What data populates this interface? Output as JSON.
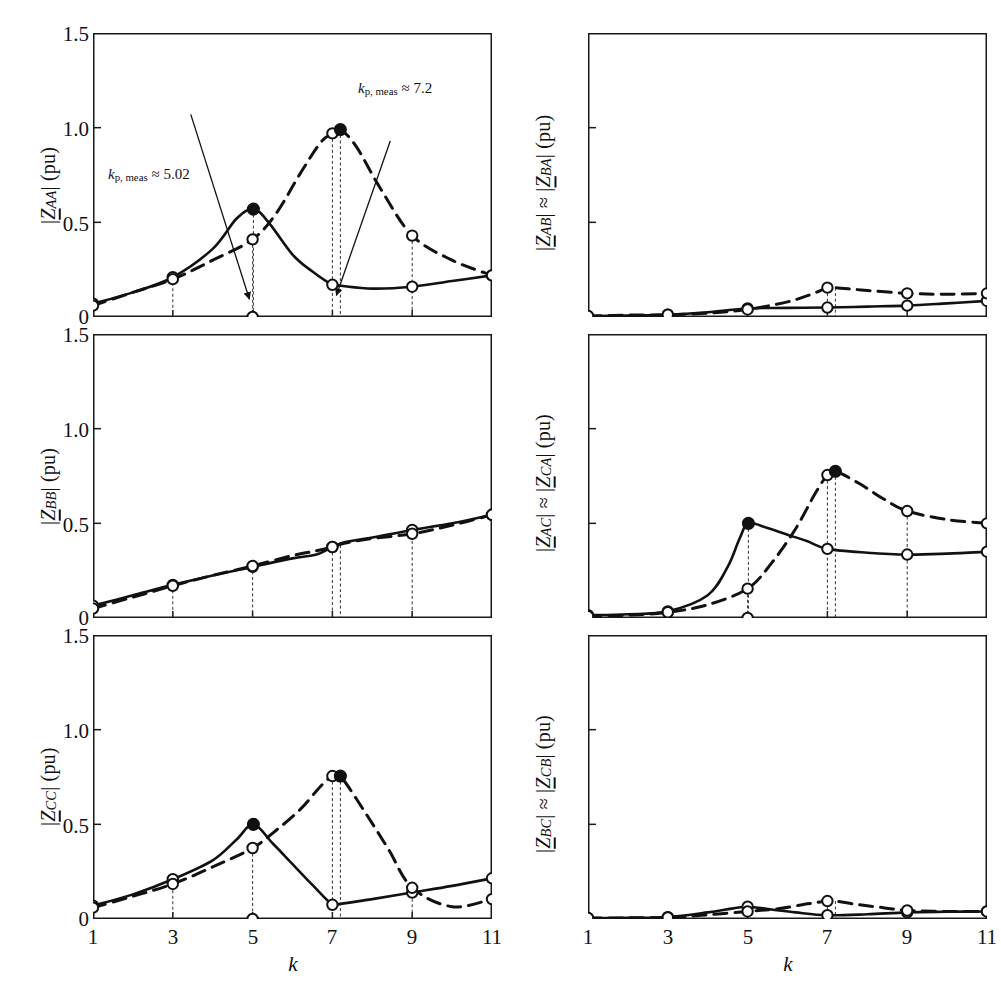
{
  "figure": {
    "xlabel": "k",
    "x_ticks": [
      "1",
      "3",
      "5",
      "7",
      "9",
      "11"
    ],
    "y_ticks": [
      "0",
      "0.5",
      "1.0",
      "1.5"
    ],
    "annotations": [
      {
        "id": "kp502",
        "text_prefix": "k",
        "text_sub": "p, meas",
        "text_value": " ≈ 5.02"
      },
      {
        "id": "kp72",
        "text_prefix": "k",
        "text_sub": "p, meas",
        "text_value": " ≈ 7.2"
      }
    ],
    "panels": [
      {
        "id": "ZAA",
        "ylabel_plain": "|Z_AA| (pu)"
      },
      {
        "id": "ZAB",
        "ylabel_plain": "|Z_AB| ≈ |Z_BA| (pu)"
      },
      {
        "id": "ZBB",
        "ylabel_plain": "|Z_BB| (pu)"
      },
      {
        "id": "ZAC",
        "ylabel_plain": "|Z_AC| ≈ |Z_CA| (pu)"
      },
      {
        "id": "ZCC",
        "ylabel_plain": "|Z_CC| (pu)"
      },
      {
        "id": "ZBC",
        "ylabel_plain": "|Z_BC| ≈ |Z_CB| (pu)"
      }
    ]
  },
  "chart_data": [
    {
      "type": "line",
      "id": "ZAA",
      "title": "",
      "xlabel": "k",
      "ylabel": "|Z_AA| (pu)",
      "xlim": [
        1,
        11
      ],
      "ylim": [
        0,
        1.5
      ],
      "xticks": [
        1,
        3,
        5,
        7,
        9,
        11
      ],
      "yticks": [
        0,
        0.5,
        1.0,
        1.5
      ],
      "grid": false,
      "legend": "none",
      "series": [
        {
          "name": "solid",
          "style": "solid",
          "x": [
            1,
            2,
            3,
            4,
            4.6,
            5.02,
            5.4,
            6,
            6.5,
            7,
            7.2,
            8,
            9,
            10,
            11
          ],
          "y": [
            0.07,
            0.13,
            0.21,
            0.36,
            0.52,
            0.57,
            0.5,
            0.33,
            0.24,
            0.17,
            0.165,
            0.15,
            0.16,
            0.19,
            0.22
          ],
          "markers_open_x": [
            1,
            3,
            5,
            7,
            9,
            11
          ],
          "markers_open_y": [
            0.07,
            0.21,
            0.0,
            0.17,
            0.16,
            0.22
          ],
          "markers_filled_x": [
            5.02
          ],
          "markers_filled_y": [
            0.57
          ]
        },
        {
          "name": "dashed",
          "style": "dashed",
          "x": [
            1,
            2,
            3,
            4,
            5,
            5.6,
            6.2,
            6.7,
            7,
            7.2,
            7.6,
            8.2,
            9,
            10,
            11
          ],
          "y": [
            0.06,
            0.13,
            0.2,
            0.3,
            0.41,
            0.55,
            0.76,
            0.92,
            0.97,
            0.99,
            0.9,
            0.68,
            0.43,
            0.3,
            0.22
          ],
          "markers_open_x": [
            1,
            3,
            5,
            7,
            9,
            11
          ],
          "markers_open_y": [
            0.06,
            0.2,
            0.41,
            0.97,
            0.43,
            0.22
          ],
          "markers_filled_x": [
            7.2
          ],
          "markers_filled_y": [
            0.99
          ]
        }
      ],
      "drop_lines": [
        {
          "x": 5.02,
          "y_top": 0.57,
          "y_bottom": 0.0
        },
        {
          "x": 5.0,
          "y_top": 0.41,
          "y_bottom": 0.0
        },
        {
          "x": 7.0,
          "y_top": 0.97,
          "y_bottom": 0.0
        },
        {
          "x": 7.2,
          "y_top": 0.99,
          "y_bottom": 0.0
        },
        {
          "x": 9.0,
          "y_top": 0.43,
          "y_bottom": 0.0
        },
        {
          "x": 3.0,
          "y_top": 0.21,
          "y_bottom": 0.0
        }
      ],
      "annotations": [
        {
          "label": "k_p,meas = 5.02",
          "points_to_x": 5.02,
          "points_to_y": 0.02
        },
        {
          "label": "k_p,meas = 7.2",
          "points_to_x": 7.2,
          "points_to_y": 0.04
        }
      ]
    },
    {
      "type": "line",
      "id": "ZAB",
      "title": "",
      "xlabel": "k",
      "ylabel": "|Z_AB| ≈ |Z_BA| (pu)",
      "xlim": [
        1,
        11
      ],
      "ylim": [
        0,
        1.5
      ],
      "xticks": [
        1,
        3,
        5,
        7,
        9,
        11
      ],
      "yticks": [
        0,
        0.5,
        1.0,
        1.5
      ],
      "grid": false,
      "legend": "none",
      "series": [
        {
          "name": "solid",
          "style": "solid",
          "x": [
            1,
            2,
            3,
            4,
            5,
            6,
            7,
            8,
            9,
            10,
            11
          ],
          "y": [
            0.005,
            0.008,
            0.012,
            0.025,
            0.045,
            0.048,
            0.05,
            0.055,
            0.06,
            0.072,
            0.085
          ],
          "markers_open_x": [
            1,
            3,
            5,
            7,
            9,
            11
          ],
          "markers_open_y": [
            0.005,
            0.012,
            0.045,
            0.05,
            0.06,
            0.085
          ],
          "markers_filled_x": [],
          "markers_filled_y": []
        },
        {
          "name": "dashed",
          "style": "dashed",
          "x": [
            1,
            2,
            3,
            4,
            5,
            6,
            6.6,
            7,
            7.2,
            8,
            9,
            10,
            11
          ],
          "y": [
            0.005,
            0.01,
            0.012,
            0.02,
            0.04,
            0.08,
            0.12,
            0.155,
            0.155,
            0.14,
            0.125,
            0.12,
            0.125
          ],
          "markers_open_x": [
            1,
            3,
            5,
            7,
            9,
            11
          ],
          "markers_open_y": [
            0.005,
            0.012,
            0.04,
            0.155,
            0.125,
            0.125
          ],
          "markers_filled_x": [],
          "markers_filled_y": []
        }
      ],
      "drop_lines": [
        {
          "x": 7.0,
          "y_top": 0.155,
          "y_bottom": 0.0
        },
        {
          "x": 7.2,
          "y_top": 0.155,
          "y_bottom": 0.0
        },
        {
          "x": 9.0,
          "y_top": 0.125,
          "y_bottom": 0.0
        }
      ],
      "annotations": []
    },
    {
      "type": "line",
      "id": "ZBB",
      "title": "",
      "xlabel": "k",
      "ylabel": "|Z_BB| (pu)",
      "xlim": [
        1,
        11
      ],
      "ylim": [
        0,
        1.5
      ],
      "xticks": [
        1,
        3,
        5,
        7,
        9,
        11
      ],
      "yticks": [
        0,
        0.5,
        1.0,
        1.5
      ],
      "grid": false,
      "legend": "none",
      "series": [
        {
          "name": "solid",
          "style": "solid",
          "x": [
            1,
            2,
            3,
            4,
            5,
            6,
            6.6,
            7,
            7.3,
            8,
            9,
            10,
            11
          ],
          "y": [
            0.065,
            0.12,
            0.175,
            0.225,
            0.27,
            0.315,
            0.335,
            0.375,
            0.4,
            0.425,
            0.465,
            0.5,
            0.545
          ],
          "markers_open_x": [
            1,
            3,
            5,
            7,
            9,
            11
          ],
          "markers_open_y": [
            0.065,
            0.175,
            0.27,
            0.375,
            0.465,
            0.545
          ],
          "markers_filled_x": [],
          "markers_filled_y": []
        },
        {
          "name": "dashed",
          "style": "dashed",
          "x": [
            1,
            2,
            3,
            4,
            5,
            6,
            6.6,
            7,
            7.3,
            8,
            9,
            10,
            11
          ],
          "y": [
            0.05,
            0.11,
            0.17,
            0.225,
            0.275,
            0.33,
            0.355,
            0.375,
            0.395,
            0.42,
            0.445,
            0.49,
            0.545
          ],
          "markers_open_x": [
            1,
            3,
            5,
            7,
            9,
            11
          ],
          "markers_open_y": [
            0.05,
            0.17,
            0.275,
            0.375,
            0.445,
            0.545
          ],
          "markers_filled_x": [],
          "markers_filled_y": []
        }
      ],
      "drop_lines": [
        {
          "x": 3.0,
          "y_top": 0.175,
          "y_bottom": 0.0
        },
        {
          "x": 5.0,
          "y_top": 0.275,
          "y_bottom": 0.0
        },
        {
          "x": 7.0,
          "y_top": 0.375,
          "y_bottom": 0.0
        },
        {
          "x": 7.2,
          "y_top": 0.385,
          "y_bottom": 0.0
        },
        {
          "x": 9.0,
          "y_top": 0.465,
          "y_bottom": 0.0
        }
      ],
      "annotations": []
    },
    {
      "type": "line",
      "id": "ZAC",
      "title": "",
      "xlabel": "k",
      "ylabel": "|Z_AC| ≈ |Z_CA| (pu)",
      "xlim": [
        1,
        11
      ],
      "ylim": [
        0,
        1.5
      ],
      "xticks": [
        1,
        3,
        5,
        7,
        9,
        11
      ],
      "yticks": [
        0,
        0.5,
        1.0,
        1.5
      ],
      "grid": false,
      "legend": "none",
      "series": [
        {
          "name": "solid",
          "style": "solid",
          "x": [
            1,
            2,
            3,
            4,
            4.5,
            4.8,
            5.02,
            5.5,
            6,
            6.5,
            7,
            8,
            9,
            10,
            11
          ],
          "y": [
            0.015,
            0.02,
            0.035,
            0.12,
            0.27,
            0.42,
            0.5,
            0.475,
            0.44,
            0.405,
            0.365,
            0.345,
            0.335,
            0.34,
            0.35
          ],
          "markers_open_x": [
            1,
            3,
            5,
            7,
            9,
            11
          ],
          "markers_open_y": [
            0.015,
            0.035,
            0.0,
            0.365,
            0.335,
            0.35
          ],
          "markers_filled_x": [
            5.02
          ],
          "markers_filled_y": [
            0.5
          ]
        },
        {
          "name": "dashed",
          "style": "dashed",
          "x": [
            1,
            2,
            3,
            4,
            5,
            5.6,
            6.2,
            6.7,
            7,
            7.2,
            7.8,
            8.4,
            9,
            10,
            11
          ],
          "y": [
            0.01,
            0.015,
            0.03,
            0.07,
            0.155,
            0.29,
            0.47,
            0.66,
            0.755,
            0.775,
            0.71,
            0.63,
            0.565,
            0.52,
            0.5
          ],
          "markers_open_x": [
            1,
            3,
            5,
            7,
            9,
            11
          ],
          "markers_open_y": [
            0.01,
            0.03,
            0.155,
            0.755,
            0.565,
            0.5
          ],
          "markers_filled_x": [
            7.2
          ],
          "markers_filled_y": [
            0.775
          ]
        }
      ],
      "drop_lines": [
        {
          "x": 5.02,
          "y_top": 0.5,
          "y_bottom": 0.0
        },
        {
          "x": 5.0,
          "y_top": 0.155,
          "y_bottom": 0.0
        },
        {
          "x": 7.0,
          "y_top": 0.755,
          "y_bottom": 0.0
        },
        {
          "x": 7.2,
          "y_top": 0.775,
          "y_bottom": 0.0
        },
        {
          "x": 9.0,
          "y_top": 0.565,
          "y_bottom": 0.0
        }
      ],
      "annotations": []
    },
    {
      "type": "line",
      "id": "ZCC",
      "title": "",
      "xlabel": "k",
      "ylabel": "|Z_CC| (pu)",
      "xlim": [
        1,
        11
      ],
      "ylim": [
        0,
        1.5
      ],
      "xticks": [
        1,
        3,
        5,
        7,
        9,
        11
      ],
      "yticks": [
        0,
        0.5,
        1.0,
        1.5
      ],
      "grid": false,
      "legend": "none",
      "series": [
        {
          "name": "solid",
          "style": "solid",
          "x": [
            1,
            2,
            3,
            4,
            4.6,
            5.02,
            5.5,
            6,
            6.5,
            7,
            7.2,
            8,
            9,
            10,
            11
          ],
          "y": [
            0.07,
            0.13,
            0.21,
            0.31,
            0.42,
            0.5,
            0.4,
            0.29,
            0.18,
            0.075,
            0.08,
            0.105,
            0.14,
            0.175,
            0.215
          ],
          "markers_open_x": [
            1,
            3,
            5,
            7,
            9,
            11
          ],
          "markers_open_y": [
            0.07,
            0.21,
            0.0,
            0.075,
            0.14,
            0.215
          ],
          "markers_filled_x": [
            5.02
          ],
          "markers_filled_y": [
            0.5
          ]
        },
        {
          "name": "dashed",
          "style": "dashed",
          "x": [
            1,
            2,
            3,
            4,
            5,
            5.6,
            6.2,
            6.7,
            7,
            7.2,
            7.8,
            8.4,
            9,
            10,
            11
          ],
          "y": [
            0.06,
            0.12,
            0.185,
            0.275,
            0.375,
            0.47,
            0.58,
            0.7,
            0.755,
            0.755,
            0.57,
            0.37,
            0.165,
            0.065,
            0.105
          ],
          "markers_open_x": [
            1,
            3,
            5,
            7,
            9,
            11
          ],
          "markers_open_y": [
            0.06,
            0.185,
            0.375,
            0.755,
            0.165,
            0.105
          ],
          "markers_filled_x": [
            7.2
          ],
          "markers_filled_y": [
            0.755
          ]
        }
      ],
      "drop_lines": [
        {
          "x": 3.0,
          "y_top": 0.21,
          "y_bottom": 0.0
        },
        {
          "x": 5.0,
          "y_top": 0.375,
          "y_bottom": 0.0
        },
        {
          "x": 7.0,
          "y_top": 0.755,
          "y_bottom": 0.0
        },
        {
          "x": 7.2,
          "y_top": 0.755,
          "y_bottom": 0.0
        },
        {
          "x": 9.0,
          "y_top": 0.165,
          "y_bottom": 0.0
        }
      ],
      "annotations": []
    },
    {
      "type": "line",
      "id": "ZBC",
      "title": "",
      "xlabel": "k",
      "ylabel": "|Z_BC| ≈ |Z_CB| (pu)",
      "xlim": [
        1,
        11
      ],
      "ylim": [
        0,
        1.5
      ],
      "xticks": [
        1,
        3,
        5,
        7,
        9,
        11
      ],
      "yticks": [
        0,
        0.5,
        1.0,
        1.5
      ],
      "grid": false,
      "legend": "none",
      "series": [
        {
          "name": "solid",
          "style": "solid",
          "x": [
            1,
            2,
            3,
            4,
            4.6,
            5,
            5.6,
            6.2,
            7,
            8,
            9,
            10,
            11
          ],
          "y": [
            0.005,
            0.006,
            0.01,
            0.035,
            0.055,
            0.065,
            0.05,
            0.035,
            0.02,
            0.025,
            0.035,
            0.038,
            0.04
          ],
          "markers_open_x": [
            1,
            3,
            5,
            7,
            9,
            11
          ],
          "markers_open_y": [
            0.005,
            0.01,
            0.065,
            0.02,
            0.035,
            0.04
          ],
          "markers_filled_x": [],
          "markers_filled_y": []
        },
        {
          "name": "dashed",
          "style": "dashed",
          "x": [
            1,
            2,
            3,
            4,
            5,
            5.8,
            6.5,
            7,
            7.2,
            7.8,
            8.4,
            9,
            10,
            11
          ],
          "y": [
            0.005,
            0.006,
            0.008,
            0.022,
            0.04,
            0.055,
            0.08,
            0.095,
            0.095,
            0.075,
            0.06,
            0.045,
            0.04,
            0.04
          ],
          "markers_open_x": [
            1,
            3,
            5,
            7,
            9,
            11
          ],
          "markers_open_y": [
            0.005,
            0.008,
            0.04,
            0.095,
            0.045,
            0.04
          ],
          "markers_filled_x": [],
          "markers_filled_y": []
        }
      ],
      "drop_lines": [
        {
          "x": 7.0,
          "y_top": 0.095,
          "y_bottom": 0.0
        },
        {
          "x": 7.2,
          "y_top": 0.095,
          "y_bottom": 0.0
        },
        {
          "x": 9.0,
          "y_top": 0.045,
          "y_bottom": 0.0
        }
      ],
      "annotations": []
    }
  ]
}
